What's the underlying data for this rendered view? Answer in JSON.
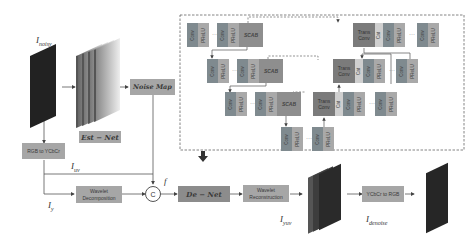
{
  "labels": {
    "i_noisy": "I",
    "i_noisy_sub": "noisy",
    "i_uv": "I",
    "i_uv_sub": "uv",
    "i_y": "I",
    "i_y_sub": "y",
    "f": "f",
    "i_yuv": "I",
    "i_yuv_sub": "yuv",
    "i_denoise": "I",
    "i_denoise_sub": "denoise"
  },
  "boxes": {
    "est_net": "Est − Net",
    "noise_map": "Noise Map",
    "rgb_to_ycbcr": "RGB to YCbCr",
    "wavelet_decomposition": "Wavelet Decomposition",
    "concat": "C",
    "de_net": "De − Net",
    "wavelet_reconstruction": "Wavelet Reconstruction",
    "ycbcr_to_rgb": "YCbCr to RGB"
  },
  "blocks": {
    "conv": "Conv",
    "prelu": "PReLU",
    "scab": "SCAB",
    "trans_conv": "Trans Conv",
    "cat": "Cat",
    "ellipsis": "···"
  },
  "colors": {
    "box_fill": "#a6a6a6",
    "conv_fill": "#7f8a8f",
    "prelu_fill": "#a9a9a9",
    "scab_fill": "#8e8e8e",
    "trans_conv_fill": "#7b7b7b",
    "cat_fill": "#cfcfcf",
    "line": "#555555"
  }
}
